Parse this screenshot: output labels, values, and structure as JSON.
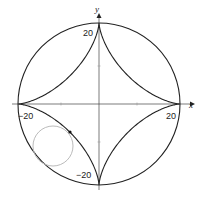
{
  "diagram": {
    "axes": {
      "x_label": "x",
      "y_label": "y",
      "tick_labels": {
        "x_pos": "20",
        "x_neg": "−20",
        "y_pos": "20",
        "y_neg": "−20"
      }
    },
    "geometry": {
      "center_px": [
        99,
        104
      ],
      "outer_radius_px": 81,
      "rolling_circle_center_px": [
        53,
        146
      ],
      "rolling_circle_radius_px": 20,
      "tracing_point_px": [
        70,
        132
      ]
    },
    "colors": {
      "curve": "#222222",
      "axis": "#333333",
      "rolling_circle": "#bbbbbb",
      "point": "#111111"
    }
  }
}
